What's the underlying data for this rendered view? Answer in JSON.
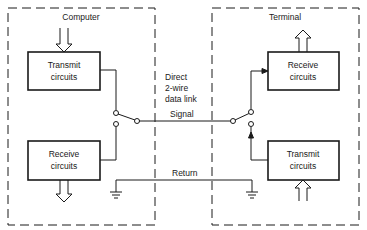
{
  "diagram": {
    "colors": {
      "line": "#1a1a1a",
      "background": "#ffffff"
    },
    "computer": {
      "title": "Computer",
      "transmit": {
        "line1": "Transmit",
        "line2": "circuits"
      },
      "receive": {
        "line1": "Receive",
        "line2": "circuits"
      }
    },
    "terminal": {
      "title": "Terminal",
      "receive": {
        "line1": "Receive",
        "line2": "circuits"
      },
      "transmit": {
        "line1": "Transmit",
        "line2": "circuits"
      }
    },
    "link": {
      "line1": "Direct",
      "line2": "2-wire",
      "line3": "data link",
      "signal": "Signal",
      "return": "Return"
    }
  }
}
